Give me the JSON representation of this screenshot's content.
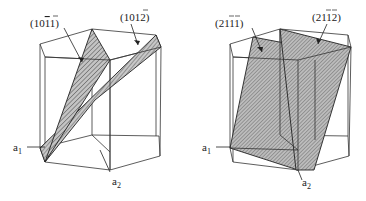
{
  "figure": {
    "left": {
      "planes": [
        {
          "label_main": "(10",
          "label_bar": "1",
          "label_end": "1)",
          "full": "(10̄1̄1)"
        },
        {
          "label_main": "(10",
          "label_bar": "1",
          "label_end": "2)",
          "full": "(10̄1 2)"
        }
      ],
      "axes": {
        "a1": "a",
        "a1_sub": "1",
        "a2": "a",
        "a2_sub": "2"
      }
    },
    "right": {
      "planes": [
        {
          "full": "(2̄1̄1 1)"
        },
        {
          "full": "(2̄1̄1 2)"
        }
      ],
      "axes": {
        "a1": "a",
        "a1_sub": "1",
        "a2": "a",
        "a2_sub": "2"
      }
    },
    "labels": {
      "l1_pre": "(10",
      "l1_bar": "1",
      "l1_post": "1)",
      "l2_pre": "(10",
      "l2_bar": "1",
      "l2_post": "2)",
      "r1_pre": "(2",
      "r1_bar": "11",
      "r1_post": "1)",
      "r2_pre": "(2",
      "r2_bar": "11",
      "r2_post": "2)",
      "a": "a",
      "sub1": "1",
      "sub2": "2"
    },
    "colors": {
      "line": "#333333",
      "hatch_fill": "#bdbdbd",
      "hatch_line": "#444444",
      "background": "#ffffff"
    }
  }
}
